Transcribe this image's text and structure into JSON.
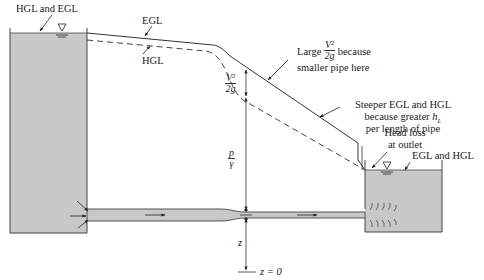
{
  "labels": {
    "hgl_egl_left": "HGL and EGL",
    "egl_top": "EGL",
    "hgl_top": "HGL",
    "large_prefix": "Large",
    "large_suffix": "because",
    "large_line2": "smaller pipe here",
    "steeper_line1": "Steeper EGL and HGL",
    "steeper_line2_prefix": "because greater",
    "steeper_hl": "h",
    "steeper_hl_sub": "L",
    "steeper_line3": "per length of pipe",
    "head_loss_line1": "Head loss",
    "head_loss_line2": "at outlet",
    "egl_hgl_right": "EGL and HGL",
    "z_zero": "z = 0",
    "z_label": "z"
  },
  "fractions": {
    "velocity_head_num": "V²",
    "velocity_head_den": "2g",
    "pressure_head_num": "p",
    "pressure_head_den": "γ"
  },
  "colors": {
    "water": "#c8c8c8",
    "line": "#333333",
    "background": "#ffffff"
  }
}
